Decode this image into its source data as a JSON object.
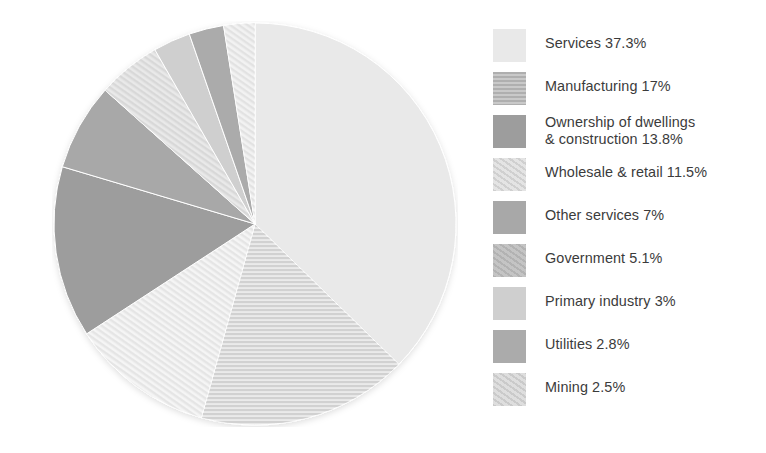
{
  "chart_data": {
    "type": "pie",
    "title": "",
    "xlabel": "",
    "ylabel": "",
    "legend_position": "right",
    "grid": false,
    "units": "percent",
    "start_angle_deg": 0,
    "direction": "clockwise",
    "categories": [
      "Services",
      "Manufacturing",
      "Ownership of dwellings & construction",
      "Wholesale & retail",
      "Other services",
      "Government",
      "Primary industry",
      "Utilities",
      "Mining"
    ],
    "values": [
      37.3,
      17,
      13.8,
      11.5,
      7,
      5.1,
      3,
      2.8,
      2.5
    ],
    "slice_order_clockwise_from_top": [
      "Services",
      "Manufacturing",
      "Wholesale & retail",
      "Ownership of dwellings & construction",
      "Other services",
      "Government",
      "Primary industry",
      "Utilities",
      "Mining"
    ],
    "slices": [
      {
        "label": "Services",
        "value": 37.3,
        "value_text": "37.3%",
        "color": "#e9e9e9",
        "pattern": "solid"
      },
      {
        "label": "Manufacturing",
        "value": 17,
        "value_text": "17%",
        "color": "#c9c9c9",
        "pattern": "horizontal-stripe"
      },
      {
        "label": "Ownership of dwellings\n& construction",
        "value": 13.8,
        "value_text": "13.8%",
        "color": "#9d9d9d",
        "pattern": "solid"
      },
      {
        "label": "Wholesale & retail",
        "value": 11.5,
        "value_text": "11.5%",
        "color": "#e4e4e4",
        "pattern": "diagonal-stripe"
      },
      {
        "label": "Other services",
        "value": 7,
        "value_text": "7%",
        "color": "#a8a8a8",
        "pattern": "solid"
      },
      {
        "label": "Government",
        "value": 5.1,
        "value_text": "5.1%",
        "color": "#c4c4c4",
        "pattern": "diagonal-stripe"
      },
      {
        "label": "Primary industry",
        "value": 3,
        "value_text": "3%",
        "color": "#cfcfcf",
        "pattern": "solid"
      },
      {
        "label": "Utilities",
        "value": 2.8,
        "value_text": "2.8%",
        "color": "#ababab",
        "pattern": "solid"
      },
      {
        "label": "Mining",
        "value": 2.5,
        "value_text": "2.5%",
        "color": "#dedede",
        "pattern": "diagonal-stripe"
      }
    ]
  },
  "legend": {
    "items": [
      {
        "text": "Services 37.3%",
        "color": "#e9e9e9",
        "swatch_name": "legend-swatch-services"
      },
      {
        "text": "Manufacturing 17%",
        "color": "#c9c9c9",
        "swatch_name": "legend-swatch-manufacturing"
      },
      {
        "text": "Ownership of dwellings\n& construction 13.8%",
        "color": "#9d9d9d",
        "swatch_name": "legend-swatch-ownership-of-dwellings"
      },
      {
        "text": "Wholesale & retail 11.5%",
        "color": "#e4e4e4",
        "swatch_name": "legend-swatch-wholesale-retail"
      },
      {
        "text": "Other services 7%",
        "color": "#a8a8a8",
        "swatch_name": "legend-swatch-other-services"
      },
      {
        "text": "Government 5.1%",
        "color": "#c4c4c4",
        "swatch_name": "legend-swatch-government"
      },
      {
        "text": "Primary industry 3%",
        "color": "#cfcfcf",
        "swatch_name": "legend-swatch-primary-industry"
      },
      {
        "text": "Utilities 2.8%",
        "color": "#ababab",
        "swatch_name": "legend-swatch-utilities"
      },
      {
        "text": "Mining 2.5%",
        "color": "#dedede",
        "swatch_name": "legend-swatch-mining"
      }
    ]
  },
  "style": {
    "background": "#ffffff",
    "text_color": "#3b3b3b"
  }
}
